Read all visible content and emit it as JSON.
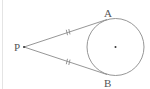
{
  "diagram": {
    "colors": {
      "stroke": "#8a8a8a",
      "label": "#555555",
      "background": "#ffffff"
    },
    "points": {
      "P": {
        "label": "P",
        "x": 24,
        "y": 47
      },
      "A": {
        "label": "A",
        "x": 107,
        "y": 21
      },
      "B": {
        "label": "B",
        "x": 107,
        "y": 73
      },
      "O": {
        "label": "",
        "x": 115.5,
        "y": 47
      }
    },
    "circle": {
      "cx": 115.5,
      "cy": 47,
      "r": 28.5
    },
    "labels": {
      "P": "P",
      "A": "A",
      "B": "B"
    },
    "tick_marks": {
      "PA": "double",
      "PB": "double"
    }
  }
}
